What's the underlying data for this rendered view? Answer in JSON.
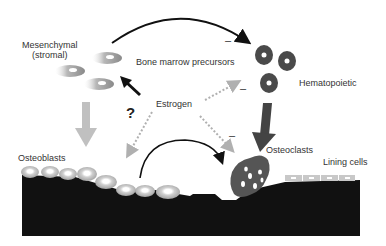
{
  "labels": {
    "mesenchymal_line1": "Mesenchymal",
    "mesenchymal_line2": "(stromal)",
    "bone_marrow_precursors": "Bone marrow precursors",
    "hematopoietic": "Hematopoietic",
    "estrogen": "Estrogen",
    "question_mark": "?",
    "osteoblasts": "Osteoblasts",
    "osteoclasts": "Osteoclasts",
    "lining_cells": "Lining cells",
    "minus_1": "–",
    "minus_2": "–",
    "minus_3": "–"
  },
  "colors": {
    "bone": "#111111",
    "hematopoietic_cell": "#4a4a4a",
    "osteoclast": "#555555",
    "osteoblast_cell": "#c8c8c8",
    "gray_arrow": "#c0c0c0",
    "dark_arrow": "#444444",
    "dotted_arrow": "#b0b0b0",
    "text": "#333333"
  }
}
